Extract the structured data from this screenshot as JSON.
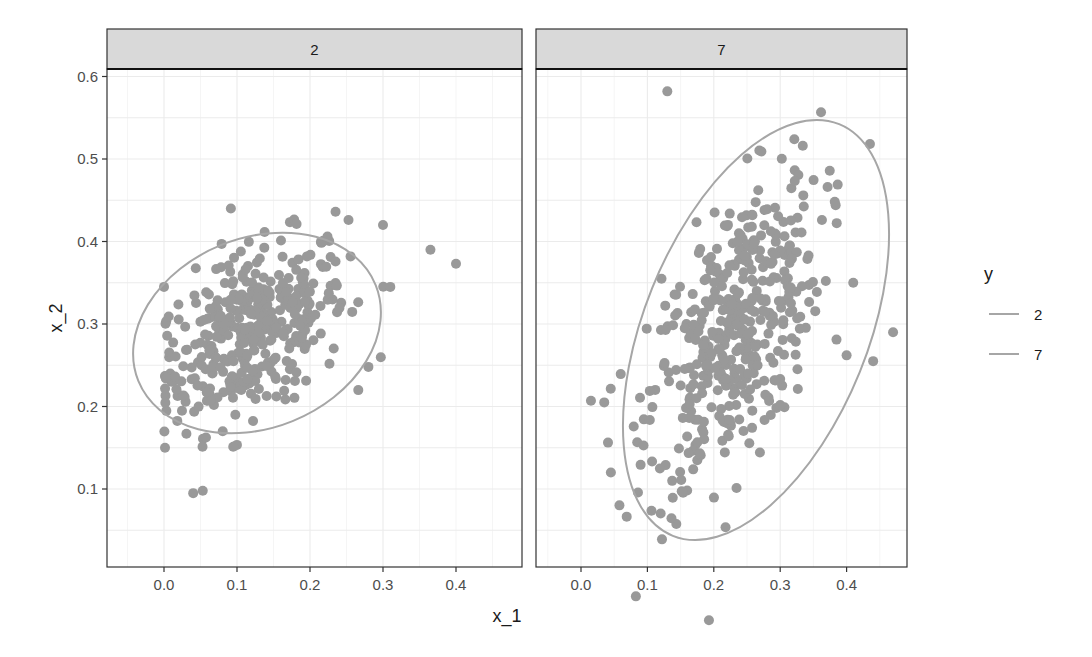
{
  "chart_data": {
    "type": "scatter",
    "title": "",
    "xlabel": "x_1",
    "ylabel": "x_2",
    "facet_variable": "y",
    "facets": [
      {
        "label": "2",
        "xlim": [
          -0.06,
          0.48
        ],
        "ylim": [
          0.005,
          0.61
        ],
        "ellipse": {
          "cx": 0.127,
          "cy": 0.29,
          "note": "normal confidence ellipse, tilted positive"
        },
        "outliers": [
          [
            0.04,
            0.095
          ],
          [
            0.365,
            0.39
          ],
          [
            0.4,
            0.373
          ],
          [
            0.235,
            0.436
          ],
          [
            0.3,
            0.42
          ],
          [
            0.31,
            0.345
          ],
          [
            0.28,
            0.248
          ],
          [
            0.0,
            0.345
          ]
        ],
        "cluster": {
          "center": [
            0.12,
            0.29
          ],
          "sd_x": 0.065,
          "sd_y": 0.055,
          "corr": 0.45,
          "n": 400
        }
      },
      {
        "label": "7",
        "xlim": [
          -0.06,
          0.48
        ],
        "ylim": [
          0.005,
          0.61
        ],
        "ellipse": {
          "cx": 0.255,
          "cy": 0.29,
          "note": "normal confidence ellipse, tilted positive, elongated vertically"
        },
        "outliers": [
          [
            0.13,
            0.582
          ],
          [
            0.015,
            0.207
          ],
          [
            0.035,
            0.205
          ],
          [
            0.045,
            0.12
          ],
          [
            0.47,
            0.29
          ],
          [
            0.44,
            0.255
          ],
          [
            0.4,
            0.262
          ],
          [
            0.41,
            0.35
          ]
        ],
        "cluster": {
          "center": [
            0.23,
            0.29
          ],
          "sd_x": 0.065,
          "sd_y": 0.095,
          "corr": 0.55,
          "n": 450
        }
      }
    ],
    "x_ticks": [
      "0.0",
      "0.1",
      "0.2",
      "0.3",
      "0.4"
    ],
    "y_ticks": [
      "0.1",
      "0.2",
      "0.3",
      "0.4",
      "0.5",
      "0.6"
    ],
    "legend": {
      "title": "y",
      "position": "right",
      "entries": [
        {
          "label": "2",
          "color": "#a6a6a6"
        },
        {
          "label": "7",
          "color": "#a6a6a6"
        }
      ]
    },
    "grid": true,
    "point_color": "#999999",
    "strip_fill": "#d9d9d9"
  }
}
